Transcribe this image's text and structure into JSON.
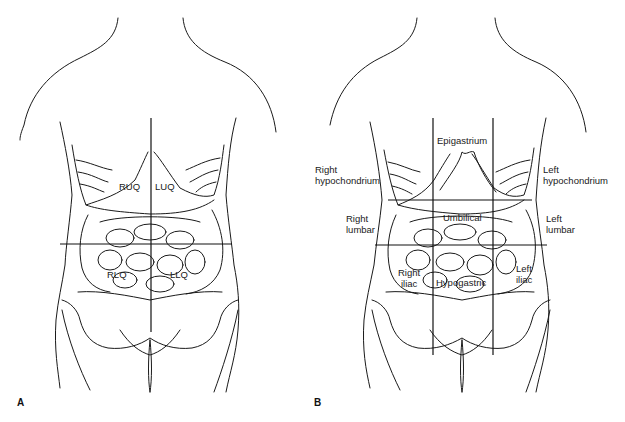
{
  "figure_a": {
    "letter": "A",
    "title": "Four abdominal quadrants",
    "labels": {
      "ruq": "RUQ",
      "luq": "LUQ",
      "rlq": "RLQ",
      "llq": "LLQ"
    }
  },
  "figure_b": {
    "letter": "B",
    "title": "Nine abdominal regions",
    "labels": {
      "epigastrium": "Epigastrium",
      "right_hypochondrium_1": "Right",
      "right_hypochondrium_2": "hypochondrium",
      "left_hypochondrium_1": "Left",
      "left_hypochondrium_2": "hypochondrium",
      "right_lumbar_1": "Right",
      "right_lumbar_2": "lumbar",
      "umbilical": "Umbilical",
      "left_lumbar_1": "Left",
      "left_lumbar_2": "lumbar",
      "right_iliac_1": "Right",
      "right_iliac_2": "iliac",
      "hypogastric": "Hypogastric",
      "left_iliac_1": "Left",
      "left_iliac_2": "iliac"
    }
  },
  "colors": {
    "line": "#1a1a1a",
    "background": "#ffffff"
  }
}
